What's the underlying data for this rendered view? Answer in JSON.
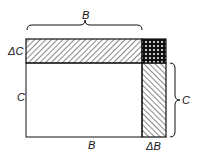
{
  "diagram": {
    "labels": {
      "top_B": "B",
      "delta_C": "ΔC",
      "left_C": "C",
      "right_C": "C",
      "bottom_B": "B",
      "delta_B": "ΔB"
    },
    "regions": [
      {
        "name": "base-area",
        "fill": "white",
        "width_label": "B",
        "height_label": "C"
      },
      {
        "name": "delta-c-strip",
        "fill": "hatched",
        "width_label": "B",
        "height_label": "ΔC"
      },
      {
        "name": "delta-b-strip",
        "fill": "hatched",
        "width_label": "ΔB",
        "height_label": "C"
      },
      {
        "name": "corner-square",
        "fill": "dotted",
        "width_label": "ΔB",
        "height_label": "ΔC"
      }
    ],
    "colors": {
      "line": "#111111",
      "background": "#ffffff"
    }
  }
}
